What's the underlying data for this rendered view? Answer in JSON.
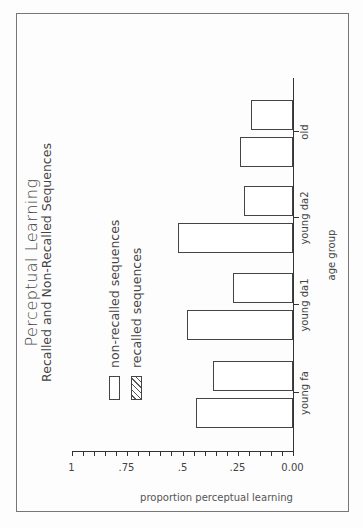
{
  "chart_data": {
    "type": "bar",
    "title": "Perceptual Learning",
    "subtitle": "Recalled and Non-Recalled Sequences",
    "xlabel": "age group",
    "ylabel": "proportion perceptual learning",
    "categories": [
      "young fa",
      "young da1",
      "young da2",
      "old"
    ],
    "series": [
      {
        "name": "recalled sequences",
        "pattern": "hatched",
        "values": [
          0.44,
          0.48,
          0.52,
          0.24
        ]
      },
      {
        "name": "non-recalled sequences",
        "pattern": "open",
        "values": [
          0.36,
          0.27,
          0.22,
          0.19
        ]
      }
    ],
    "yticks": [
      "0.00",
      ".25",
      ".5",
      ".75",
      "1"
    ],
    "ylim": [
      0,
      1
    ],
    "legend_position": "upper left",
    "grid": false,
    "orientation": "rotated 90 degrees counter-clockwise on page"
  },
  "legend": {
    "non_recalled": "non-recalled sequences",
    "recalled": "recalled sequences"
  }
}
